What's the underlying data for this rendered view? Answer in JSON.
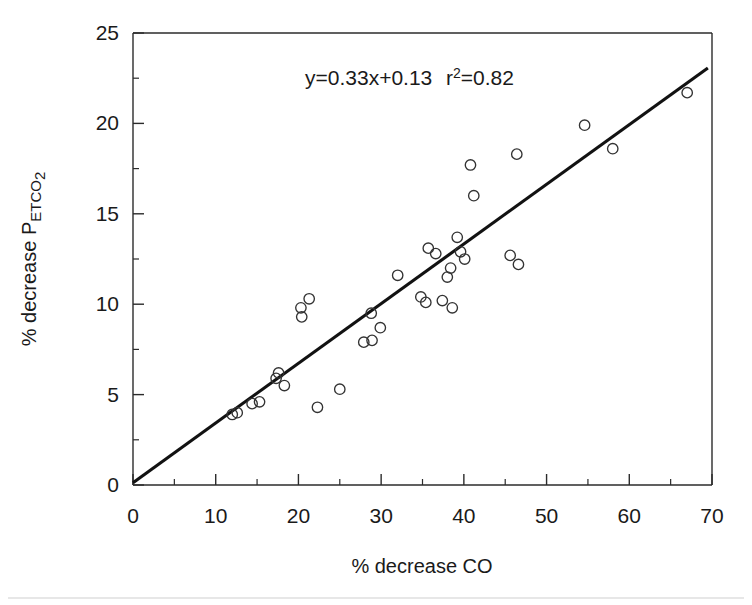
{
  "chart_data": {
    "type": "scatter",
    "title": "",
    "xlabel": "% decrease CO",
    "ylabel": "% decrease PETCO2",
    "ylabel_parts": {
      "main": "% decrease P",
      "sub1": "ET",
      "sub2": "CO",
      "sub3": "2"
    },
    "xlim": [
      0,
      70
    ],
    "ylim": [
      0,
      25
    ],
    "x_ticks": [
      0,
      10,
      20,
      30,
      40,
      50,
      60,
      70
    ],
    "y_ticks": [
      0,
      5,
      10,
      15,
      20,
      25
    ],
    "x_tick_labels": [
      "0",
      "10",
      "20",
      "30",
      "40",
      "50",
      "60",
      "70"
    ],
    "y_tick_labels": [
      "0",
      "5",
      "10",
      "15",
      "20",
      "25"
    ],
    "x_minor_ticks": [
      5,
      15,
      25,
      35,
      45,
      55,
      65
    ],
    "y_minor_ticks": [
      2.5,
      7.5,
      12.5,
      17.5,
      22.5
    ],
    "grid": false,
    "legend": null,
    "marker_style": "open-circle",
    "annotations": [
      {
        "name": "regression-equation",
        "text": "y=0.33x+0.13",
        "x": 27.5,
        "y": 22.2
      },
      {
        "name": "r-squared",
        "text": "r2=0.82",
        "text_base": "r",
        "text_sup": "2",
        "text_rest": "=0.82",
        "x": 43.5,
        "y": 22.2
      }
    ],
    "fit": {
      "name": "regression-line",
      "slope": 0.33,
      "intercept": 0.13,
      "r_squared": 0.82,
      "x_start": 0,
      "x_end": 69.5
    },
    "points": [
      {
        "x": 12.0,
        "y": 3.9
      },
      {
        "x": 12.6,
        "y": 4.0
      },
      {
        "x": 14.4,
        "y": 4.5
      },
      {
        "x": 15.3,
        "y": 4.6
      },
      {
        "x": 17.3,
        "y": 5.9
      },
      {
        "x": 17.6,
        "y": 6.2
      },
      {
        "x": 18.3,
        "y": 5.5
      },
      {
        "x": 20.3,
        "y": 9.8
      },
      {
        "x": 20.4,
        "y": 9.3
      },
      {
        "x": 21.3,
        "y": 10.3
      },
      {
        "x": 22.3,
        "y": 4.3
      },
      {
        "x": 25.0,
        "y": 5.3
      },
      {
        "x": 27.9,
        "y": 7.9
      },
      {
        "x": 28.8,
        "y": 9.5
      },
      {
        "x": 28.9,
        "y": 8.0
      },
      {
        "x": 29.9,
        "y": 8.7
      },
      {
        "x": 32.0,
        "y": 11.6
      },
      {
        "x": 34.8,
        "y": 10.4
      },
      {
        "x": 35.4,
        "y": 10.1
      },
      {
        "x": 35.7,
        "y": 13.1
      },
      {
        "x": 36.6,
        "y": 12.8
      },
      {
        "x": 37.4,
        "y": 10.2
      },
      {
        "x": 38.0,
        "y": 11.5
      },
      {
        "x": 38.4,
        "y": 12.0
      },
      {
        "x": 38.6,
        "y": 9.8
      },
      {
        "x": 39.2,
        "y": 13.7
      },
      {
        "x": 39.6,
        "y": 12.9
      },
      {
        "x": 40.1,
        "y": 12.5
      },
      {
        "x": 40.8,
        "y": 17.7
      },
      {
        "x": 41.2,
        "y": 16.0
      },
      {
        "x": 45.6,
        "y": 12.7
      },
      {
        "x": 46.4,
        "y": 18.3
      },
      {
        "x": 46.6,
        "y": 12.2
      },
      {
        "x": 54.6,
        "y": 19.9
      },
      {
        "x": 58.0,
        "y": 18.6
      },
      {
        "x": 67.0,
        "y": 21.7
      }
    ]
  },
  "figure": {
    "background_color": "#ffffff",
    "axis_color": "#2b2b2b",
    "marker_color": "#333333",
    "line_color": "#121212"
  }
}
